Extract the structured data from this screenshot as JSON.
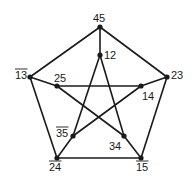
{
  "diagram": {
    "type": "petersen-graph",
    "vertices": [
      {
        "id": "45",
        "label": "45",
        "overline": false,
        "x": 100,
        "y": 27,
        "lx": 93,
        "ly": 22
      },
      {
        "id": "12",
        "label": "12",
        "overline": false,
        "x": 100,
        "y": 55,
        "lx": 104,
        "ly": 59
      },
      {
        "id": "13",
        "label": "13",
        "overline": true,
        "x": 30,
        "y": 77,
        "lx": 15,
        "ly": 79
      },
      {
        "id": "23",
        "label": "23",
        "overline": false,
        "x": 167,
        "y": 77,
        "lx": 171,
        "ly": 79
      },
      {
        "id": "25",
        "label": "25",
        "overline": false,
        "x": 57,
        "y": 86,
        "lx": 54,
        "ly": 82
      },
      {
        "id": "14",
        "label": "14",
        "overline": false,
        "x": 141,
        "y": 86,
        "lx": 142,
        "ly": 100
      },
      {
        "id": "35",
        "label": "35",
        "overline": true,
        "x": 73,
        "y": 136,
        "lx": 56,
        "ly": 137
      },
      {
        "id": "34",
        "label": "34",
        "overline": false,
        "x": 124,
        "y": 136,
        "lx": 109,
        "ly": 150
      },
      {
        "id": "24",
        "label": "24",
        "overline": true,
        "x": 57,
        "y": 158,
        "lx": 49,
        "ly": 171
      },
      {
        "id": "15",
        "label": "15",
        "overline": true,
        "x": 141,
        "y": 158,
        "lx": 136,
        "ly": 171
      }
    ],
    "edges": [
      [
        "45",
        "13"
      ],
      [
        "45",
        "23"
      ],
      [
        "13",
        "24"
      ],
      [
        "23",
        "15"
      ],
      [
        "24",
        "15"
      ],
      [
        "45",
        "12"
      ],
      [
        "13",
        "25"
      ],
      [
        "23",
        "14"
      ],
      [
        "24",
        "35"
      ],
      [
        "15",
        "34"
      ],
      [
        "12",
        "35"
      ],
      [
        "12",
        "34"
      ],
      [
        "25",
        "14"
      ],
      [
        "25",
        "34"
      ],
      [
        "14",
        "35"
      ]
    ],
    "colors": {
      "stroke": "#1a1a1a",
      "background": "#ffffff"
    }
  }
}
